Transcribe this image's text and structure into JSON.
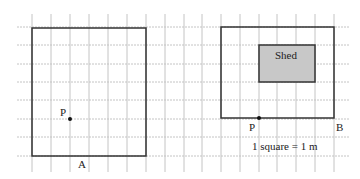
{
  "diagram": {
    "scale_label": "1 square = 1 m",
    "left_figure": {
      "point_label": "P",
      "side_label": "A"
    },
    "right_figure": {
      "shed_label": "Shed",
      "point_label": "P",
      "corner_label": "B"
    },
    "colors": {
      "grid": "#bdbdbd",
      "outline": "#333333",
      "shed_fill": "#c8c8c8"
    }
  }
}
